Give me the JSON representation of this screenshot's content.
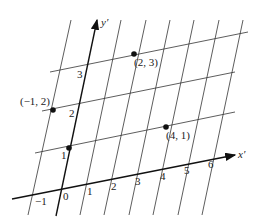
{
  "diagram": {
    "axes": {
      "x_label": "x′",
      "y_label": "y′"
    },
    "x_ticks": [
      "−1",
      "0",
      "1",
      "2",
      "3",
      "4",
      "5",
      "6"
    ],
    "y_ticks": [
      "1",
      "2",
      "3"
    ],
    "points": [
      {
        "label": "(−1, 2)",
        "x": -1,
        "y": 2
      },
      {
        "label": "(2, 3)",
        "x": 2,
        "y": 3
      },
      {
        "label": "(4, 1)",
        "x": 4,
        "y": 1
      },
      {
        "label": "",
        "x": 0,
        "y": 1
      }
    ],
    "colors": {
      "line": "#333333",
      "axis": "#111111",
      "point": "#111111"
    }
  }
}
